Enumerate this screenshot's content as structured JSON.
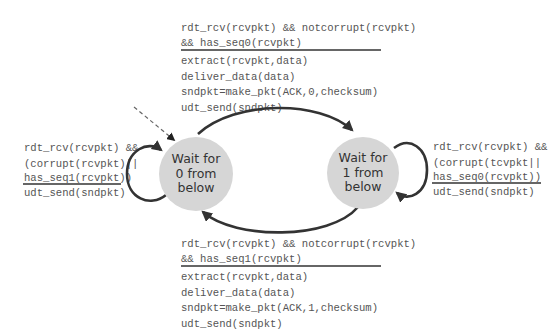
{
  "colors": {
    "state_fill": "#d6d6d6",
    "edge": "#333333",
    "text": "#555555",
    "state_text": "#333333"
  },
  "states": [
    {
      "id": "wait0",
      "label_lines": [
        "Wait for",
        "0 from",
        "below"
      ],
      "initial": true
    },
    {
      "id": "wait1",
      "label_lines": [
        "Wait for",
        "1 from",
        "below"
      ],
      "initial": false
    }
  ],
  "transitions": {
    "top": {
      "from": "wait0",
      "to": "wait1",
      "condition": [
        "rdt_rcv(rcvpkt) && notcorrupt(rcvpkt)",
        "&& has_seq0(rcvpkt)"
      ],
      "actions": [
        "extract(rcvpkt,data)",
        "deliver_data(data)",
        "sndpkt=make_pkt(ACK,0,checksum)",
        "udt_send(sndpkt)"
      ]
    },
    "bottom": {
      "from": "wait1",
      "to": "wait0",
      "condition": [
        "rdt_rcv(rcvpkt) && notcorrupt(rcvpkt)",
        "&& has_seq1(rcvpkt)"
      ],
      "actions": [
        "extract(rcvpkt,data)",
        "deliver_data(data)",
        "sndpkt=make_pkt(ACK,1,checksum)",
        "udt_send(sndpkt)"
      ]
    },
    "left_self": {
      "from": "wait0",
      "to": "wait0",
      "condition": [
        "rdt_rcv(rcvpkt) &&",
        "(corrupt(rcvpkt)||",
        "has_seq1(rcvpkt))"
      ],
      "actions": [
        "udt_send(sndpkt)"
      ]
    },
    "right_self": {
      "from": "wait1",
      "to": "wait1",
      "condition": [
        "rdt_rcv(rcvpkt) &&",
        "(corrupt(tcvpkt||",
        "has_seq0(rcvpkt))"
      ],
      "actions": [
        "udt_send(sndpkt)"
      ]
    }
  }
}
